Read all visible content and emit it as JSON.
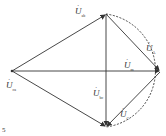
{
  "diagram": {
    "type": "phasor-diagram",
    "stroke_color": "#333333",
    "labels": [
      {
        "id": "uab",
        "base": "U",
        "sub": "ab",
        "x": 75,
        "y": 6
      },
      {
        "id": "ua",
        "base": "U",
        "sub": "A",
        "x": 146,
        "y": 42
      },
      {
        "id": "uam",
        "base": "U",
        "sub": "m",
        "x": 124,
        "y": 59
      },
      {
        "id": "uca",
        "base": "U",
        "sub": "ca",
        "x": 6,
        "y": 80
      },
      {
        "id": "ubc",
        "base": "U",
        "sub": "bc",
        "x": 92,
        "y": 87
      },
      {
        "id": "uc",
        "base": "U",
        "sub": "C",
        "x": 119,
        "y": 108
      }
    ],
    "footer_mark": "5"
  }
}
